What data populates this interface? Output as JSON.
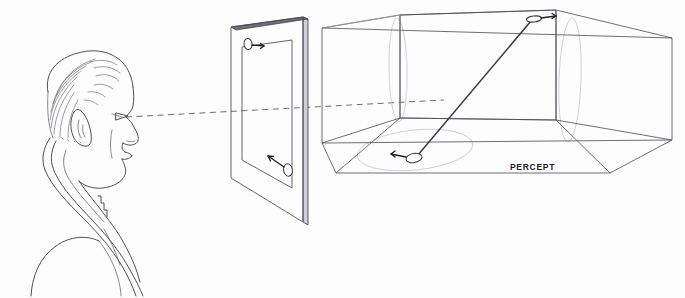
{
  "figure": {
    "background_color": "#fdfdfd",
    "ink_color": "#3b3b44",
    "soft_ink_color": "#9a9aa4",
    "ghost_color": "#c6c6cf"
  },
  "labels": {
    "percept": "PERCEPT"
  },
  "observer": {
    "name": "man-profile-head",
    "description": "Line drawing of a balding man's head and shoulders in left profile, facing right",
    "eye_point": {
      "x": 120,
      "y": 117
    }
  },
  "sight_line": {
    "name": "line-of-sight",
    "style": "dashed",
    "color": "#6d6d78",
    "from": {
      "x": 126,
      "y": 117
    },
    "to": {
      "x": 444,
      "y": 100
    }
  },
  "picture_plane": {
    "name": "transparent-picture-plane",
    "description": "Upright transparent glass panel drawn in perspective with visible slab thickness",
    "outer_quad": [
      {
        "x": 231,
        "y": 27
      },
      {
        "x": 303,
        "y": 17
      },
      {
        "x": 303,
        "y": 222
      },
      {
        "x": 231,
        "y": 178
      }
    ],
    "inner_quad": [
      {
        "x": 242,
        "y": 47
      },
      {
        "x": 292,
        "y": 40
      },
      {
        "x": 292,
        "y": 188
      },
      {
        "x": 242,
        "y": 160
      }
    ],
    "markers": [
      {
        "name": "plane-marker-top",
        "ellipse": {
          "cx": 248,
          "cy": 44,
          "rx": 4.0,
          "ry": 5.6,
          "rotate": -8
        },
        "arrow_direction": "right",
        "arrow": {
          "x1": 252,
          "y1": 45,
          "x2": 264,
          "y2": 46
        }
      },
      {
        "name": "plane-marker-bottom",
        "ellipse": {
          "cx": 288,
          "cy": 170,
          "rx": 4.4,
          "ry": 6.2,
          "rotate": -8
        },
        "arrow_direction": "up-left",
        "arrow": {
          "x1": 284,
          "y1": 167,
          "x2": 268,
          "y2": 156
        }
      }
    ]
  },
  "percept_box": {
    "name": "percept-wireframe-box",
    "description": "Transparent rectangular wireframe room in two-point perspective, open toward the viewer",
    "vertices": {
      "front_top_left": {
        "x": 322,
        "y": 28
      },
      "front_bottom_left": {
        "x": 322,
        "y": 143
      },
      "near_floor_left": {
        "x": 336,
        "y": 173
      },
      "near_floor_right": {
        "x": 610,
        "y": 173
      },
      "back_top_left": {
        "x": 400,
        "y": 15
      },
      "back_top_right": {
        "x": 556,
        "y": 10
      },
      "back_bottom_left": {
        "x": 400,
        "y": 118
      },
      "back_bottom_right": {
        "x": 556,
        "y": 120
      },
      "right_top_outer": {
        "x": 672,
        "y": 38
      },
      "right_bottom_outer": {
        "x": 672,
        "y": 140
      }
    },
    "ghost_ellipses": [
      {
        "name": "floor-ghost-ellipse",
        "cx": 415,
        "cy": 150,
        "rx": 58,
        "ry": 20,
        "rotate": -6
      },
      {
        "name": "right-wall-ghost-ellipse",
        "cx": 570,
        "cy": 80,
        "rx": 11,
        "ry": 62,
        "rotate": 2
      },
      {
        "name": "left-partition-ghost-ellipse",
        "cx": 398,
        "cy": 70,
        "rx": 9,
        "ry": 52,
        "rotate": -1
      }
    ],
    "ray": {
      "name": "percept-diagonal-ray",
      "from": {
        "x": 531,
        "y": 21
      },
      "to": {
        "x": 418,
        "y": 155
      }
    },
    "markers": [
      {
        "name": "percept-marker-top",
        "ellipse": {
          "cx": 534,
          "cy": 19,
          "rx": 7.5,
          "ry": 3.0,
          "rotate": -6
        },
        "arrow_direction": "right",
        "arrow": {
          "x1": 541,
          "y1": 18,
          "x2": 556,
          "y2": 16
        }
      },
      {
        "name": "percept-marker-bottom",
        "ellipse": {
          "cx": 414,
          "cy": 158,
          "rx": 8.0,
          "ry": 4.6,
          "rotate": -10
        },
        "arrow_direction": "left",
        "arrow": {
          "x1": 406,
          "y1": 157,
          "x2": 391,
          "y2": 154
        }
      }
    ]
  }
}
